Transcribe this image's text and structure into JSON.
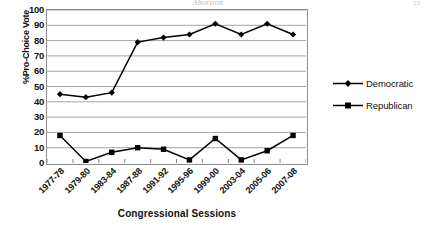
{
  "page": {
    "running_head": "Abortion",
    "page_number": "23"
  },
  "chart_data": {
    "type": "line",
    "title": "",
    "xlabel": "Congressional Sessions",
    "ylabel": "%Pro-Choice Vote",
    "ylim": [
      0,
      100
    ],
    "ytick_step": 10,
    "yticks": [
      "0",
      "10",
      "20",
      "30",
      "40",
      "50",
      "60",
      "70",
      "80",
      "90",
      "100"
    ],
    "grid": "horizontal",
    "legend_position": "right",
    "categories": [
      "1977-78",
      "1979-80",
      "1983-84",
      "1987-88",
      "1991-92",
      "1995-96",
      "1999-00",
      "2003-04",
      "2005-06",
      "2007-08"
    ],
    "series": [
      {
        "name": "Democratic",
        "marker": "diamond",
        "color": "#000000",
        "values": [
          45,
          43,
          46,
          79,
          82,
          84,
          91,
          84,
          91,
          84
        ]
      },
      {
        "name": "Republican",
        "marker": "square",
        "color": "#000000",
        "values": [
          18,
          1,
          7,
          10,
          9,
          2,
          16,
          2,
          8,
          18
        ]
      }
    ]
  },
  "legend": {
    "items": [
      {
        "label": "Democratic",
        "marker": "diamond"
      },
      {
        "label": "Republican",
        "marker": "square"
      }
    ]
  }
}
